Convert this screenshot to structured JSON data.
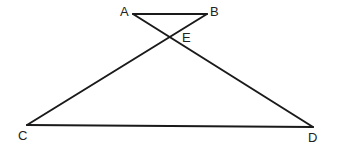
{
  "diagram": {
    "type": "geometry",
    "line_color": "#1a1a1a",
    "points": {
      "A": {
        "label": "A",
        "x": 133,
        "y": 14,
        "label_x": 120,
        "label_y": 16
      },
      "B": {
        "label": "B",
        "x": 207,
        "y": 14,
        "label_x": 210,
        "label_y": 16
      },
      "E": {
        "label": "E",
        "x": 170,
        "y": 35,
        "label_x": 182,
        "label_y": 42
      },
      "C": {
        "label": "C",
        "x": 27,
        "y": 125,
        "label_x": 18,
        "label_y": 140
      },
      "D": {
        "label": "D",
        "x": 313,
        "y": 127,
        "label_x": 308,
        "label_y": 142
      }
    },
    "segments": [
      {
        "name": "AB",
        "from": "A",
        "to": "B"
      },
      {
        "name": "AD",
        "from": "A",
        "to": "D"
      },
      {
        "name": "BC",
        "from": "B",
        "to": "C"
      },
      {
        "name": "CD",
        "from": "C",
        "to": "D"
      }
    ]
  }
}
